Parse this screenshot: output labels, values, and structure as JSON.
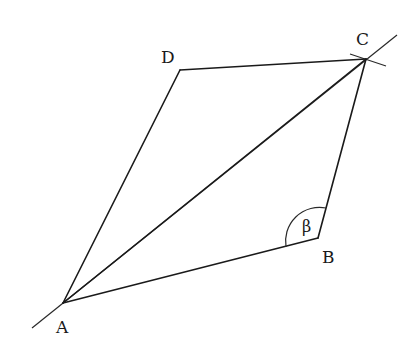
{
  "diagram": {
    "type": "geometric-construction",
    "shape": "parallelogram",
    "colors": {
      "background": "#ffffff",
      "stroke": "#1a1a1a"
    },
    "vertices": {
      "A": {
        "label": "A",
        "x": 63,
        "y": 303,
        "label_x": 56,
        "label_y": 333
      },
      "B": {
        "label": "B",
        "x": 318,
        "y": 238,
        "label_x": 322,
        "label_y": 263
      },
      "C": {
        "label": "C",
        "x": 366,
        "y": 59,
        "label_x": 356,
        "label_y": 45
      },
      "D": {
        "label": "D",
        "x": 180,
        "y": 70,
        "label_x": 161,
        "label_y": 63
      }
    },
    "edges": [
      {
        "name": "AB",
        "from": "A",
        "to": "B"
      },
      {
        "name": "BC",
        "from": "B",
        "to": "C"
      },
      {
        "name": "CD",
        "from": "C",
        "to": "D"
      },
      {
        "name": "DA",
        "from": "D",
        "to": "A"
      },
      {
        "name": "AC",
        "from": "A",
        "to": "C",
        "role": "diagonal"
      }
    ],
    "construction_line": {
      "x1": 32,
      "y1": 328,
      "x2": 397,
      "y2": 35
    },
    "construction_arc_mark": {
      "x1": 350,
      "y1": 54,
      "x2": 386,
      "y2": 66
    },
    "angle": {
      "vertex": "B",
      "symbol": "β",
      "label_x": 302,
      "label_y": 232
    }
  }
}
